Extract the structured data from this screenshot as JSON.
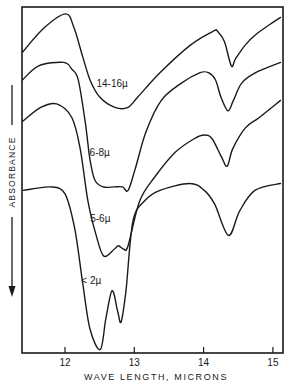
{
  "chart_data": {
    "type": "line",
    "title": "",
    "xlabel": "WAVE LENGTH, MICRONS",
    "ylabel": "ABSORBANCE",
    "ylabel_direction": "increasing downward (arrow points down)",
    "xlim": [
      11.38,
      15.15
    ],
    "x_ticks": [
      12,
      13,
      14,
      15
    ],
    "x_tick_labels": [
      "12",
      "13",
      "14",
      "15"
    ],
    "y_ticks": [],
    "grid": false,
    "legend": "inline labels on curves",
    "y_units": "relative (0 = top of plot, 1 = bottom of plot; larger = greater absorbance)",
    "series": [
      {
        "name": "14-16µ",
        "label_pos": [
          12.68,
          0.23
        ],
        "points": [
          [
            11.39,
            0.13
          ],
          [
            11.7,
            0.06
          ],
          [
            12.01,
            0.02
          ],
          [
            12.13,
            0.06
          ],
          [
            12.25,
            0.14
          ],
          [
            12.36,
            0.21
          ],
          [
            12.5,
            0.26
          ],
          [
            12.72,
            0.29
          ],
          [
            12.91,
            0.29
          ],
          [
            13.05,
            0.26
          ],
          [
            13.37,
            0.19
          ],
          [
            13.81,
            0.11
          ],
          [
            14.14,
            0.07
          ],
          [
            14.2,
            0.07
          ],
          [
            14.3,
            0.1
          ],
          [
            14.4,
            0.17
          ],
          [
            14.46,
            0.15
          ],
          [
            14.6,
            0.11
          ],
          [
            14.75,
            0.08
          ],
          [
            14.96,
            0.05
          ],
          [
            15.11,
            0.03
          ]
        ]
      },
      {
        "name": "6-8µ",
        "label_pos": [
          12.5,
          0.43
        ],
        "points": [
          [
            11.39,
            0.21
          ],
          [
            11.62,
            0.17
          ],
          [
            11.98,
            0.16
          ],
          [
            12.1,
            0.18
          ],
          [
            12.19,
            0.21
          ],
          [
            12.29,
            0.33
          ],
          [
            12.36,
            0.44
          ],
          [
            12.43,
            0.5
          ],
          [
            12.55,
            0.52
          ],
          [
            12.71,
            0.52
          ],
          [
            12.83,
            0.52
          ],
          [
            12.91,
            0.53
          ],
          [
            13.01,
            0.47
          ],
          [
            13.17,
            0.36
          ],
          [
            13.39,
            0.27
          ],
          [
            13.68,
            0.22
          ],
          [
            13.95,
            0.19
          ],
          [
            14.07,
            0.19
          ],
          [
            14.17,
            0.21
          ],
          [
            14.25,
            0.26
          ],
          [
            14.35,
            0.3
          ],
          [
            14.43,
            0.27
          ],
          [
            14.55,
            0.22
          ],
          [
            14.75,
            0.19
          ],
          [
            15.11,
            0.16
          ]
        ]
      },
      {
        "name": "5-6µ",
        "label_pos": [
          12.51,
          0.62
        ],
        "points": [
          [
            11.39,
            0.33
          ],
          [
            11.65,
            0.29
          ],
          [
            11.88,
            0.28
          ],
          [
            12.1,
            0.32
          ],
          [
            12.22,
            0.41
          ],
          [
            12.33,
            0.56
          ],
          [
            12.45,
            0.66
          ],
          [
            12.56,
            0.72
          ],
          [
            12.71,
            0.7
          ],
          [
            12.77,
            0.69
          ],
          [
            12.85,
            0.7
          ],
          [
            12.91,
            0.69
          ],
          [
            13.08,
            0.56
          ],
          [
            13.3,
            0.49
          ],
          [
            13.59,
            0.42
          ],
          [
            13.87,
            0.38
          ],
          [
            14.01,
            0.37
          ],
          [
            14.12,
            0.38
          ],
          [
            14.25,
            0.43
          ],
          [
            14.34,
            0.46
          ],
          [
            14.42,
            0.41
          ],
          [
            14.6,
            0.35
          ],
          [
            14.8,
            0.32
          ],
          [
            15.11,
            0.27
          ]
        ]
      },
      {
        "name": "< 2µ",
        "label_pos": [
          12.38,
          0.8
        ],
        "points": [
          [
            11.4,
            0.53
          ],
          [
            11.79,
            0.52
          ],
          [
            12.0,
            0.54
          ],
          [
            12.14,
            0.64
          ],
          [
            12.25,
            0.79
          ],
          [
            12.36,
            0.93
          ],
          [
            12.51,
            0.99
          ],
          [
            12.59,
            0.9
          ],
          [
            12.68,
            0.82
          ],
          [
            12.76,
            0.88
          ],
          [
            12.81,
            0.91
          ],
          [
            12.88,
            0.82
          ],
          [
            12.98,
            0.62
          ],
          [
            13.15,
            0.56
          ],
          [
            13.37,
            0.53
          ],
          [
            13.8,
            0.51
          ],
          [
            14.01,
            0.53
          ],
          [
            14.16,
            0.57
          ],
          [
            14.36,
            0.66
          ],
          [
            14.52,
            0.59
          ],
          [
            14.74,
            0.53
          ],
          [
            15.11,
            0.51
          ]
        ]
      }
    ]
  },
  "labels": {
    "xlabel": "WAVE LENGTH, MICRONS",
    "ylabel": "ABSORBANCE",
    "ticks": [
      "12",
      "13",
      "14",
      "15"
    ],
    "series": [
      "14-16µ",
      "6-8µ",
      "5-6µ",
      "< 2µ"
    ]
  }
}
